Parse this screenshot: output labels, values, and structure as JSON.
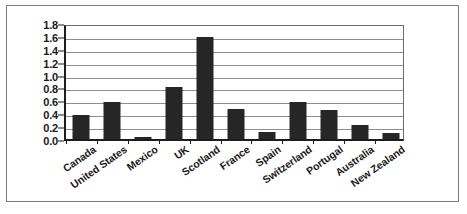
{
  "chart_data": {
    "type": "bar",
    "title": "",
    "subtitle": "",
    "xlabel": "",
    "ylabel": "",
    "ylim": [
      0.0,
      1.8
    ],
    "grid": true,
    "legend": false,
    "bar_color": "#262626",
    "categories": [
      "Canada",
      "United States",
      "Mexico",
      "UK",
      "Scotland",
      "France",
      "Spain",
      "Switzerland",
      "Portugal",
      "Australia",
      "New Zealand"
    ],
    "values": [
      0.37,
      0.57,
      0.03,
      0.81,
      1.59,
      0.46,
      0.11,
      0.58,
      0.45,
      0.21,
      0.1
    ],
    "ytick_labels": [
      "1.8",
      "1.6",
      "1.4",
      "1.2",
      "1.0",
      "0.8",
      "0.6",
      "0.4",
      "0.2",
      "0.0"
    ],
    "ytick_values": [
      1.8,
      1.6,
      1.4,
      1.2,
      1.0,
      0.8,
      0.6,
      0.4,
      0.2,
      0.0
    ]
  }
}
